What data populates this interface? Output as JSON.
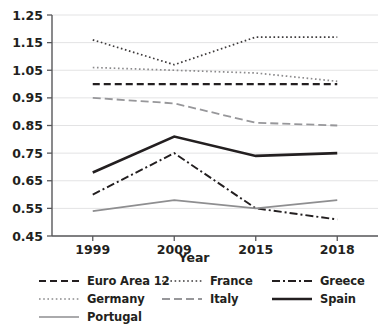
{
  "chart_data": {
    "type": "line",
    "title": "",
    "subtitle": "",
    "xlabel": "Year",
    "ylabel": "",
    "categories": [
      "1999",
      "2009",
      "2015",
      "2018"
    ],
    "x": [
      1999,
      2009,
      2015,
      2018
    ],
    "ylim": [
      0.45,
      1.25
    ],
    "yticks": [
      "0.45",
      "0.55",
      "0.65",
      "0.75",
      "0.85",
      "0.95",
      "1.05",
      "1.15",
      "1.25"
    ],
    "ytick_values": [
      0.45,
      0.55,
      0.65,
      0.75,
      0.85,
      0.95,
      1.05,
      1.15,
      1.25
    ],
    "grid": true,
    "grid_axis": "y",
    "legend_position": "bottom",
    "legend_columns": 3,
    "series": [
      {
        "name": "Euro Area 12",
        "values": [
          1.0,
          1.0,
          1.0,
          1.0
        ],
        "style": "dashed",
        "color": "#231f20",
        "width": 2.2,
        "dasharray": "7,4"
      },
      {
        "name": "France",
        "values": [
          1.16,
          1.07,
          1.17,
          1.17
        ],
        "style": "dotted",
        "color": "#3d3a3b",
        "width": 1.7,
        "dasharray": "1.6,2.6"
      },
      {
        "name": "Greece",
        "values": [
          0.6,
          0.75,
          0.55,
          0.51
        ],
        "style": "dash-dot",
        "color": "#231f20",
        "width": 1.9,
        "dasharray": "8,3,2,3"
      },
      {
        "name": "Germany",
        "values": [
          1.06,
          1.05,
          1.04,
          1.01
        ],
        "style": "dotted",
        "color": "#8b8a8c",
        "width": 1.7,
        "dasharray": "1.6,2.6"
      },
      {
        "name": "Italy",
        "values": [
          0.95,
          0.93,
          0.86,
          0.85
        ],
        "style": "long-dash",
        "color": "#97979a",
        "width": 1.8,
        "dasharray": "8,4"
      },
      {
        "name": "Spain",
        "values": [
          0.68,
          0.81,
          0.74,
          0.75
        ],
        "style": "solid",
        "color": "#231f20",
        "width": 2.6,
        "dasharray": "none"
      },
      {
        "name": "Portugal",
        "values": [
          0.54,
          0.58,
          0.55,
          0.58
        ],
        "style": "solid",
        "color": "#8e8e90",
        "width": 1.6,
        "dasharray": "none"
      }
    ]
  },
  "axes": {
    "x_title": "Year",
    "xtick_labels": [
      "1999",
      "2009",
      "2015",
      "2018"
    ],
    "ytick_labels": [
      "1.25",
      "1.15",
      "1.05",
      "0.95",
      "0.85",
      "0.75",
      "0.65",
      "0.55",
      "0.45"
    ]
  },
  "legend": {
    "rows": [
      [
        {
          "label": "Euro Area 12",
          "key": "Euro Area 12"
        },
        {
          "label": "France",
          "key": "France"
        },
        {
          "label": "Greece",
          "key": "Greece"
        }
      ],
      [
        {
          "label": "Germany",
          "key": "Germany"
        },
        {
          "label": "Italy",
          "key": "Italy"
        },
        {
          "label": "Spain",
          "key": "Spain"
        }
      ],
      [
        {
          "label": "Portugal",
          "key": "Portugal"
        }
      ]
    ]
  },
  "colors": {
    "axis": "#58585b",
    "grid": "#e3e3e4",
    "text": "#231f20",
    "background": "#ffffff"
  }
}
